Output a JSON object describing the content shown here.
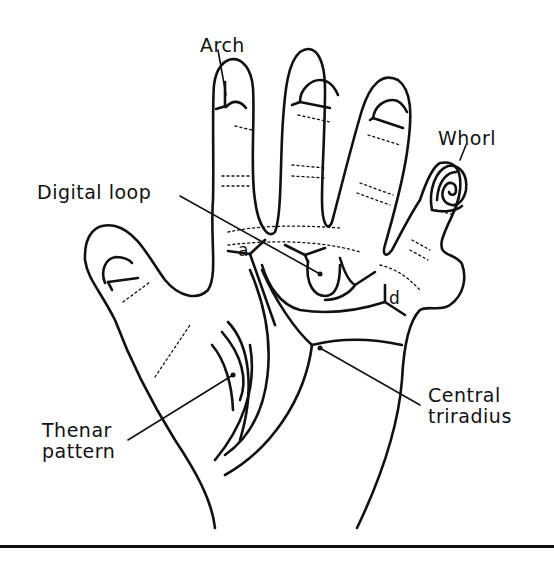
{
  "figure": {
    "type": "palm-dermatoglyphics-diagram",
    "labels": {
      "arch": "Arch",
      "whorl": "Whorl",
      "digital_loop": "Digital loop",
      "triradius_a": "a",
      "triradius_d": "d",
      "thenar_line1": "Thenar",
      "thenar_line2": "pattern",
      "central_line1": "Central",
      "central_line2": "triradius"
    },
    "colors": {
      "ink": "#111111",
      "background": "#ffffff"
    }
  }
}
